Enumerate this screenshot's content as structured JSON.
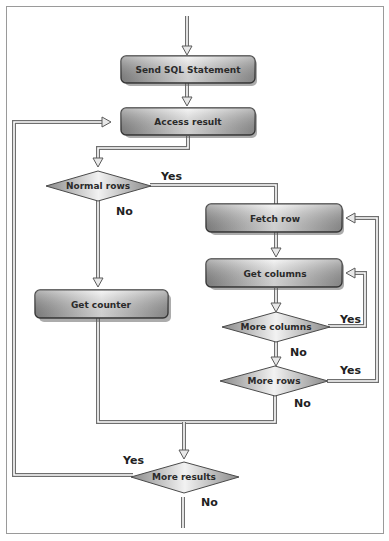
{
  "diagram": {
    "type": "flowchart",
    "colors": {
      "frame_border": "#9a9a9a",
      "box_fill_dark": "#8e8e8e",
      "box_fill_light": "#f4f4f4",
      "box_border": "#3a3a3a",
      "connector": "#6f6f6f",
      "text": "#2a2a2a"
    },
    "nodes": {
      "send_sql": {
        "label": "Send SQL Statement",
        "shape": "rounded-rect"
      },
      "access_result": {
        "label": "Access result",
        "shape": "rounded-rect"
      },
      "normal_rows": {
        "label": "Normal rows",
        "shape": "diamond"
      },
      "fetch_row": {
        "label": "Fetch row",
        "shape": "rounded-rect"
      },
      "get_columns": {
        "label": "Get columns",
        "shape": "rounded-rect"
      },
      "more_columns": {
        "label": "More columns",
        "shape": "diamond"
      },
      "more_rows": {
        "label": "More rows",
        "shape": "diamond"
      },
      "get_counter": {
        "label": "Get counter",
        "shape": "rounded-rect"
      },
      "more_results": {
        "label": "More results",
        "shape": "diamond"
      }
    },
    "edge_labels": {
      "normal_rows_yes": "Yes",
      "normal_rows_no": "No",
      "more_columns_yes": "Yes",
      "more_columns_no": "No",
      "more_rows_yes": "Yes",
      "more_rows_no": "No",
      "more_results_yes": "Yes",
      "more_results_no": "No"
    },
    "edges": [
      {
        "from": "start",
        "to": "send_sql"
      },
      {
        "from": "send_sql",
        "to": "access_result"
      },
      {
        "from": "access_result",
        "to": "normal_rows"
      },
      {
        "from": "normal_rows",
        "to": "fetch_row",
        "label": "Yes"
      },
      {
        "from": "normal_rows",
        "to": "get_counter",
        "label": "No"
      },
      {
        "from": "fetch_row",
        "to": "get_columns"
      },
      {
        "from": "get_columns",
        "to": "more_columns"
      },
      {
        "from": "more_columns",
        "to": "get_columns",
        "label": "Yes"
      },
      {
        "from": "more_columns",
        "to": "more_rows",
        "label": "No"
      },
      {
        "from": "more_rows",
        "to": "fetch_row",
        "label": "Yes"
      },
      {
        "from": "more_rows",
        "to": "more_results",
        "label": "No"
      },
      {
        "from": "get_counter",
        "to": "more_results"
      },
      {
        "from": "more_results",
        "to": "access_result",
        "label": "Yes"
      },
      {
        "from": "more_results",
        "to": "end",
        "label": "No"
      }
    ]
  }
}
